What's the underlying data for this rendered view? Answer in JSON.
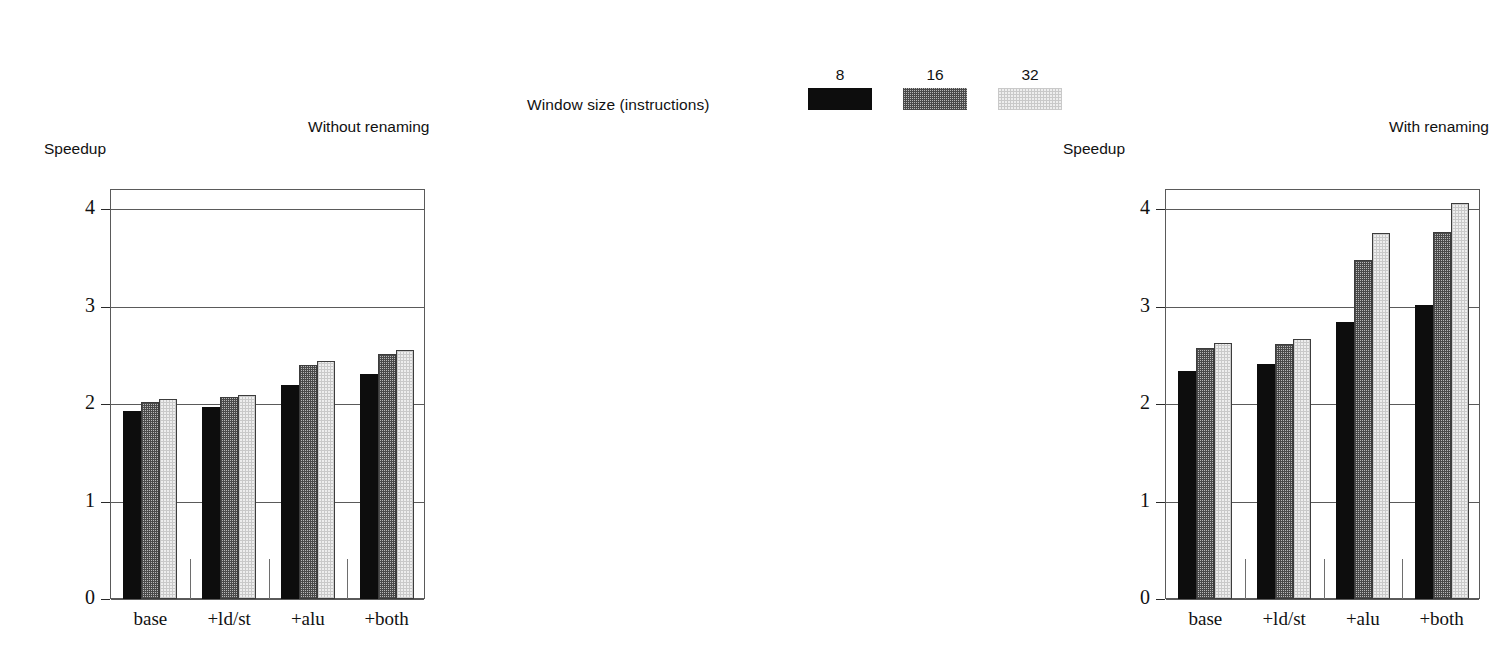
{
  "legend": {
    "title": "Window size (instructions)",
    "entries": [
      {
        "label": "8",
        "swatch": "solid-black-swatch"
      },
      {
        "label": "16",
        "swatch": "dark-hatched-swatch"
      },
      {
        "label": "32",
        "swatch": "light-hatched-swatch"
      }
    ]
  },
  "panels": [
    {
      "id": "left",
      "title": "Without renaming",
      "ylabel": "Speedup"
    },
    {
      "id": "right",
      "title": "With renaming",
      "ylabel": "Speedup"
    }
  ],
  "axis": {
    "yticks": [
      "0",
      "1",
      "2",
      "3",
      "4"
    ],
    "ytick_values": [
      0,
      1,
      2,
      3,
      4
    ],
    "categories": [
      "base",
      "+ld/st",
      "+alu",
      "+both"
    ]
  },
  "chart_data": [
    {
      "type": "bar",
      "title": "Without renaming",
      "xlabel": "",
      "ylabel": "Speedup",
      "ylim": [
        0,
        4.2
      ],
      "yticks": [
        0,
        1,
        2,
        3,
        4
      ],
      "grid": true,
      "legend_title": "Window size (instructions)",
      "legend_position": "top-right",
      "categories": [
        "base",
        "+ld/st",
        "+alu",
        "+both"
      ],
      "series": [
        {
          "name": "8",
          "values": [
            1.93,
            1.97,
            2.2,
            2.31
          ]
        },
        {
          "name": "16",
          "values": [
            2.02,
            2.07,
            2.4,
            2.52
          ]
        },
        {
          "name": "32",
          "values": [
            2.05,
            2.09,
            2.44,
            2.56
          ]
        }
      ]
    },
    {
      "type": "bar",
      "title": "With renaming",
      "xlabel": "",
      "ylabel": "Speedup",
      "ylim": [
        0,
        4.2
      ],
      "yticks": [
        0,
        1,
        2,
        3,
        4
      ],
      "grid": true,
      "legend_title": "Window size (instructions)",
      "legend_position": "top-right",
      "categories": [
        "base",
        "+ld/st",
        "+alu",
        "+both"
      ],
      "series": [
        {
          "name": "8",
          "values": [
            2.34,
            2.41,
            2.84,
            3.02
          ]
        },
        {
          "name": "16",
          "values": [
            2.58,
            2.62,
            3.48,
            3.77
          ]
        },
        {
          "name": "32",
          "values": [
            2.63,
            2.67,
            3.76,
            4.07
          ]
        }
      ]
    }
  ]
}
